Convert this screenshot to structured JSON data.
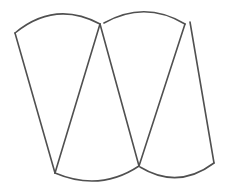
{
  "diagram": {
    "background": "#ffffff",
    "stroke_color": "#505050",
    "stroke_width": 1.6,
    "vertices": {
      "top_left": [
        15,
        33
      ],
      "top_mid_left": [
        100,
        24
      ],
      "top_mid_right": [
        104,
        23
      ],
      "top_right_arc_end": [
        185,
        24
      ],
      "top_right_line_start": [
        190,
        22
      ],
      "bottom_left": [
        55,
        173
      ],
      "bottom_mid": [
        139,
        166
      ],
      "bottom_right": [
        214,
        163
      ]
    },
    "arcs": [
      {
        "name": "top-left-arc",
        "from": [
          15,
          33
        ],
        "control": [
          55,
          0
        ],
        "to": [
          100,
          24
        ]
      },
      {
        "name": "top-right-arc",
        "from": [
          104,
          23
        ],
        "control": [
          145,
          0
        ],
        "to": [
          185,
          24
        ]
      },
      {
        "name": "bottom-left-arc",
        "from": [
          55,
          173
        ],
        "control": [
          100,
          192
        ],
        "to": [
          139,
          166
        ]
      },
      {
        "name": "bottom-right-arc",
        "from": [
          140,
          167
        ],
        "control": [
          178,
          190
        ],
        "to": [
          214,
          163
        ]
      }
    ],
    "lines": [
      {
        "name": "left-edge",
        "from": [
          15,
          33
        ],
        "to": [
          55,
          173
        ]
      },
      {
        "name": "diagonal-1",
        "from": [
          100,
          24
        ],
        "to": [
          55,
          173
        ]
      },
      {
        "name": "diagonal-2",
        "from": [
          100,
          24
        ],
        "to": [
          139,
          166
        ]
      },
      {
        "name": "diagonal-3",
        "from": [
          185,
          24
        ],
        "to": [
          139,
          166
        ]
      },
      {
        "name": "right-edge",
        "from": [
          190,
          22
        ],
        "to": [
          214,
          163
        ]
      }
    ]
  }
}
